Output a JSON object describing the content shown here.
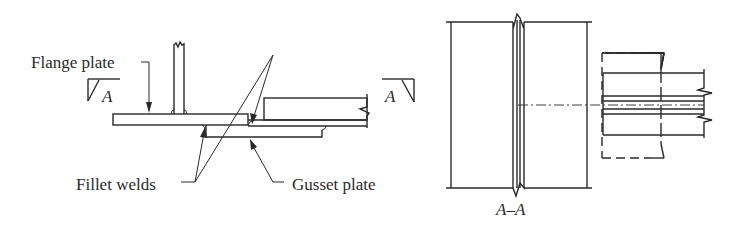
{
  "diagram": {
    "type": "structural steel connection detail",
    "left_view": {
      "labels": {
        "flange_plate": "Flange plate",
        "fillet_welds": "Fillet welds",
        "gusset_plate": "Gusset plate",
        "section_mark_left": "A",
        "section_mark_right": "A"
      }
    },
    "right_view": {
      "labels": {
        "section_title": "A–A"
      }
    },
    "colors": {
      "line": "#2a2a2a",
      "background": "#ffffff"
    }
  }
}
